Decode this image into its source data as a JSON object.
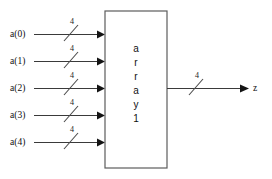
{
  "diagram": {
    "type": "block-diagram",
    "background_color": "#ffffff",
    "line_color": "#3a3a3a",
    "block": {
      "name": "array1",
      "label_chars": [
        "a",
        "r",
        "r",
        "a",
        "y",
        "1"
      ],
      "outline_color": "#5c5c5c",
      "fill_color": "#ffffff"
    },
    "inputs": [
      {
        "label": "a(0)",
        "bus_width": "4"
      },
      {
        "label": "a(1)",
        "bus_width": "4"
      },
      {
        "label": "a(2)",
        "bus_width": "4"
      },
      {
        "label": "a(3)",
        "bus_width": "4"
      },
      {
        "label": "a(4)",
        "bus_width": "4"
      }
    ],
    "outputs": [
      {
        "label": "z",
        "bus_width": "4"
      }
    ]
  }
}
